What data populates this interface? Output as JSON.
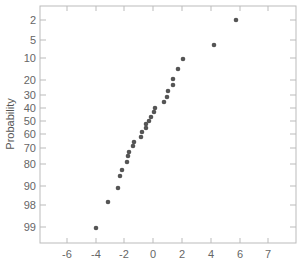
{
  "chart_data": {
    "type": "scatter",
    "title": "",
    "xlabel": "",
    "ylabel": "Probability",
    "grid": false,
    "legend": null,
    "x_ticks": [
      "-6",
      "-4",
      "-2",
      "0",
      "2",
      "4",
      "6",
      "7"
    ],
    "x_tick_values": [
      -6,
      -4,
      -2,
      0,
      2,
      4,
      6,
      8
    ],
    "xlim": [
      -7.9,
      10
    ],
    "y_ticks": [
      "2",
      "5",
      "10",
      "20",
      "30",
      "40",
      "50",
      "60",
      "70",
      "80",
      "90",
      "98",
      "99"
    ],
    "y_scale": "probability (normal)",
    "points": [
      {
        "x": 5.7,
        "p": 2
      },
      {
        "x": 4.2,
        "p": 6
      },
      {
        "x": 2.1,
        "p": 10
      },
      {
        "x": 1.7,
        "p": 14
      },
      {
        "x": 1.4,
        "p": 19
      },
      {
        "x": 1.4,
        "p": 22
      },
      {
        "x": 1.0,
        "p": 26
      },
      {
        "x": 0.9,
        "p": 30
      },
      {
        "x": 0.8,
        "p": 33
      },
      {
        "x": 0.1,
        "p": 37
      },
      {
        "x": 0.1,
        "p": 40
      },
      {
        "x": -0.1,
        "p": 44
      },
      {
        "x": -0.3,
        "p": 47
      },
      {
        "x": -0.5,
        "p": 50
      },
      {
        "x": -0.5,
        "p": 53
      },
      {
        "x": -0.8,
        "p": 56
      },
      {
        "x": -0.9,
        "p": 60
      },
      {
        "x": -1.3,
        "p": 63
      },
      {
        "x": -1.4,
        "p": 66
      },
      {
        "x": -1.7,
        "p": 70
      },
      {
        "x": -1.7,
        "p": 73
      },
      {
        "x": -1.8,
        "p": 77
      },
      {
        "x": -2.2,
        "p": 80
      },
      {
        "x": -2.3,
        "p": 83
      },
      {
        "x": -2.4,
        "p": 88
      },
      {
        "x": -3.1,
        "p": 93
      },
      {
        "x": -4.0,
        "p": 99.3
      }
    ]
  },
  "render": {
    "frame": {
      "left": 40,
      "top": 6,
      "right": 296,
      "bottom": 243
    },
    "x_tick_px": [
      67,
      96,
      124,
      153,
      182,
      211,
      240,
      268
    ],
    "y_tick_px": [
      20,
      40,
      58,
      80,
      95,
      108,
      121,
      134,
      148,
      164,
      186,
      205,
      227
    ],
    "point_px": [
      [
        236,
        20
      ],
      [
        214,
        45
      ],
      [
        183,
        59
      ],
      [
        178,
        69
      ],
      [
        173,
        79
      ],
      [
        173,
        85
      ],
      [
        168,
        91
      ],
      [
        167,
        97
      ],
      [
        164,
        102
      ],
      [
        155,
        108
      ],
      [
        154,
        112
      ],
      [
        151,
        117
      ],
      [
        149,
        121
      ],
      [
        146,
        124
      ],
      [
        146,
        128
      ],
      [
        142,
        132
      ],
      [
        141,
        137
      ],
      [
        134,
        142
      ],
      [
        133,
        146
      ],
      [
        129,
        152
      ],
      [
        128,
        156
      ],
      [
        127,
        162
      ],
      [
        122,
        170
      ],
      [
        120,
        176
      ],
      [
        118,
        188
      ],
      [
        108,
        202
      ],
      [
        96,
        228
      ]
    ],
    "colors": {
      "frame": "#bbbbbb",
      "tick": "#bbbbbb",
      "point": "#555555",
      "label": "#666666"
    }
  }
}
